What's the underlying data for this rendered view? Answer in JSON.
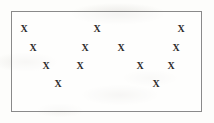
{
  "figure": {
    "marker_glyph": "X",
    "marker_color": "#2b2b2b",
    "border_color": "#8a8a8a",
    "background_color": "#fdfdfb",
    "marker_count": 13
  },
  "chart_data": {
    "type": "scatter",
    "title": "",
    "subtitle": "",
    "xlabel": "",
    "ylabel": "",
    "xlim": [
      0,
      191
    ],
    "ylim": [
      0,
      101
    ],
    "grid": false,
    "legend": null,
    "axis_ticks": {
      "x": [],
      "y": []
    },
    "marker_symbol": "X",
    "series": [
      {
        "name": "points",
        "points": [
          {
            "label": "X",
            "x": 12,
            "y": 17
          },
          {
            "label": "X",
            "x": 85,
            "y": 17
          },
          {
            "label": "X",
            "x": 169,
            "y": 17
          },
          {
            "label": "X",
            "x": 21,
            "y": 36
          },
          {
            "label": "X",
            "x": 73,
            "y": 36
          },
          {
            "label": "X",
            "x": 109,
            "y": 36
          },
          {
            "label": "X",
            "x": 164,
            "y": 36
          },
          {
            "label": "X",
            "x": 34,
            "y": 54
          },
          {
            "label": "X",
            "x": 68,
            "y": 54
          },
          {
            "label": "X",
            "x": 128,
            "y": 54
          },
          {
            "label": "X",
            "x": 159,
            "y": 54
          },
          {
            "label": "X",
            "x": 46,
            "y": 72
          },
          {
            "label": "X",
            "x": 144,
            "y": 72
          }
        ]
      }
    ],
    "rows": [
      {
        "row": 1,
        "count": 3
      },
      {
        "row": 2,
        "count": 4
      },
      {
        "row": 3,
        "count": 4
      },
      {
        "row": 4,
        "count": 2
      }
    ]
  }
}
